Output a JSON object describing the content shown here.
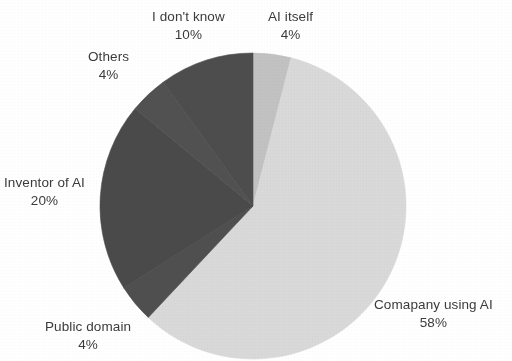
{
  "chart_data": {
    "type": "pie",
    "title": "",
    "subtitle": "",
    "xlabel": "",
    "ylabel": "",
    "legend_position": "none",
    "labels_position": "outside",
    "grid": false,
    "total": 100,
    "unit": "%",
    "start_angle_deg": 0,
    "direction": "clockwise",
    "categories": [
      "AI itself",
      "Comapany using AI",
      "Public domain",
      "Inventor of AI",
      "Others",
      "I don't know"
    ],
    "values": [
      4,
      58,
      4,
      20,
      4,
      10
    ],
    "colors": [
      "#c2c2c2",
      "#d9d9d9",
      "#4f4f4f",
      "#4a4a4a",
      "#515151",
      "#4d4d4d"
    ],
    "slices": [
      {
        "name": "AI itself",
        "value": 4,
        "value_label": "4%",
        "color": "#c2c2c2",
        "start_deg": 0,
        "end_deg": 14.4
      },
      {
        "name": "Comapany using AI",
        "value": 58,
        "value_label": "58%",
        "color": "#d9d9d9",
        "start_deg": 14.4,
        "end_deg": 223.2
      },
      {
        "name": "Public domain",
        "value": 4,
        "value_label": "4%",
        "color": "#4f4f4f",
        "start_deg": 223.2,
        "end_deg": 237.6
      },
      {
        "name": "Inventor of AI",
        "value": 20,
        "value_label": "20%",
        "color": "#4a4a4a",
        "start_deg": 237.6,
        "end_deg": 309.6
      },
      {
        "name": "Others",
        "value": 4,
        "value_label": "4%",
        "color": "#515151",
        "start_deg": 309.6,
        "end_deg": 324.0
      },
      {
        "name": "I don't know",
        "value": 10,
        "value_label": "10%",
        "color": "#4d4d4d",
        "start_deg": 324.0,
        "end_deg": 360.0
      }
    ]
  },
  "labels": {
    "ai_itself": {
      "name": "AI itself",
      "value": "4%"
    },
    "company_using_ai": {
      "name": "Comapany using AI",
      "value": "58%"
    },
    "public_domain": {
      "name": "Public domain",
      "value": "4%"
    },
    "inventor_of_ai": {
      "name": "Inventor of AI",
      "value": "20%"
    },
    "others": {
      "name": "Others",
      "value": "4%"
    },
    "i_dont_know": {
      "name": "I don't know",
      "value": "10%"
    }
  },
  "style": {
    "background": "#ffffff",
    "text_color": "#3b3b3b",
    "light_slice_color": "#d9d9d9",
    "medium_slice_color": "#c2c2c2",
    "dark_slice_color": "#4a4a4a"
  }
}
